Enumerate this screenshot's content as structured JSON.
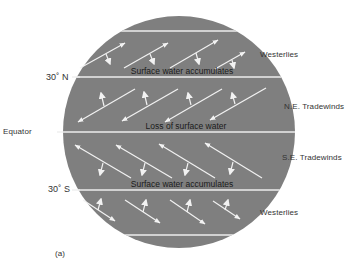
{
  "figure": {
    "panel_label": "(a)",
    "colors": {
      "globe_fill": "#7f7f7f",
      "lines_arrows": "#f2f2f2",
      "text": "#333333"
    },
    "latitude_labels": [
      {
        "text": "30˚ N",
        "y": 77
      },
      {
        "text": "Equator",
        "y": 132
      },
      {
        "text": "30˚ S",
        "y": 190
      }
    ],
    "wind_labels": [
      {
        "text": "Westerlies",
        "band": "north-westerlies"
      },
      {
        "text": "N.E. Tradewinds",
        "band": "ne-tradewinds"
      },
      {
        "text": "S.E. Tradewinds",
        "band": "se-tradewinds"
      },
      {
        "text": "Westerlies",
        "band": "south-westerlies"
      }
    ],
    "inner_labels": [
      {
        "text": "Surface water accumulates",
        "position": "just above 30˚ N"
      },
      {
        "text": "Loss of surface water",
        "position": "just above Equator"
      },
      {
        "text": "Surface water accumulates",
        "position": "just above 30˚ S"
      }
    ],
    "bands": [
      {
        "name": "north-westerlies",
        "wind_direction": "NE (toward upper-right)",
        "ekman_transport": "toward 30˚ N (down)",
        "arrow_count": 4
      },
      {
        "name": "ne-tradewinds",
        "wind_direction": "SW (toward lower-left)",
        "ekman_transport": "toward 30˚ N (up)",
        "arrow_count": 4
      },
      {
        "name": "se-tradewinds",
        "wind_direction": "NW (toward upper-left)",
        "ekman_transport": "toward 30˚ S (down)",
        "arrow_count": 4
      },
      {
        "name": "south-westerlies",
        "wind_direction": "SE (toward lower-right)",
        "ekman_transport": "toward 30˚ S (up)",
        "arrow_count": 4
      }
    ]
  }
}
